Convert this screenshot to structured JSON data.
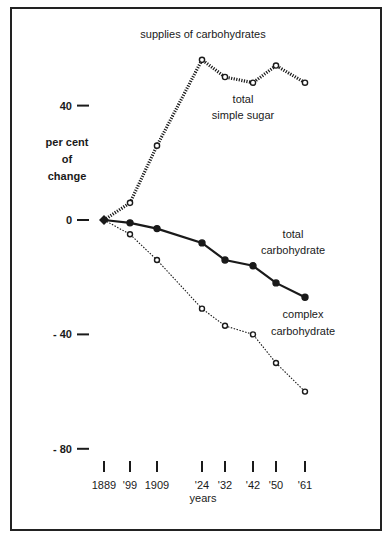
{
  "chart_data": {
    "type": "line",
    "title": "supplies of carbohydrates",
    "xlabel": "years",
    "ylabel": "per cent of change",
    "ylabel_lines": [
      "per cent",
      "of",
      "change"
    ],
    "x": [
      1889,
      1899,
      1909,
      1924,
      1932,
      1942,
      1950,
      1961
    ],
    "x_tick_labels": [
      "1889",
      "'99",
      "1909",
      "'24",
      "'32",
      "'42",
      "'50",
      "'61"
    ],
    "y_ticks": [
      40,
      0,
      -40,
      -80
    ],
    "y_tick_labels": [
      "40",
      "0",
      "- 40",
      "- 80"
    ],
    "ylim": [
      -80,
      60
    ],
    "grid": false,
    "legend": "inline labels",
    "series": [
      {
        "name": "total simple sugar",
        "label_lines": [
          "total",
          "simple sugar"
        ],
        "style": "heavy dotted, open circles",
        "values": [
          0,
          6,
          26,
          56,
          50,
          48,
          54,
          48
        ]
      },
      {
        "name": "total carbohydrate",
        "label_lines": [
          "total",
          "carbohydrate"
        ],
        "style": "solid, filled circles",
        "values": [
          0,
          -1,
          -3,
          -8,
          -14,
          -16,
          -22,
          -27
        ]
      },
      {
        "name": "complex carbohydrate",
        "label_lines": [
          "complex",
          "carbohydrate"
        ],
        "style": "light dotted, open circles",
        "values": [
          0,
          -5,
          -14,
          -31,
          -37,
          -40,
          -50,
          -60
        ]
      }
    ]
  },
  "colors": {
    "ink": "#1a1a1a",
    "background": "#ffffff"
  }
}
